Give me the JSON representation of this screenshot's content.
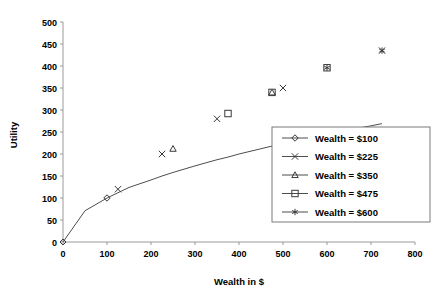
{
  "chart_data": {
    "type": "line",
    "title": "",
    "xlabel": "Wealth in $",
    "ylabel": "Utility",
    "xlim": [
      0,
      800
    ],
    "ylim": [
      0,
      500
    ],
    "xticks": [
      "0",
      "100",
      "200",
      "300",
      "400",
      "500",
      "600",
      "700",
      "800"
    ],
    "yticks": [
      "0",
      "50",
      "100",
      "150",
      "200",
      "250",
      "300",
      "350",
      "400",
      "450",
      "500"
    ],
    "grid": false,
    "legend_position": "center-right",
    "curve": {
      "name": "utility-curve",
      "x": [
        0,
        50,
        100,
        150,
        200,
        225,
        250,
        300,
        350,
        375,
        400,
        450,
        475,
        500,
        550,
        600,
        650,
        700,
        725
      ],
      "y": [
        0,
        71,
        100,
        124,
        141,
        150,
        158,
        173,
        187,
        193,
        200,
        212,
        218,
        224,
        234,
        245,
        255,
        264,
        269
      ]
    },
    "series": [
      {
        "name": "Wealth = $100",
        "marker": "diamond",
        "x": [
          100
        ],
        "y": [
          100
        ]
      },
      {
        "name": "Wealth = $225",
        "marker": "x",
        "x": [
          125,
          225,
          350,
          500,
          725
        ],
        "y": [
          120,
          200,
          280,
          350,
          435
        ]
      },
      {
        "name": "Wealth = $350",
        "marker": "triangle",
        "x": [
          250,
          475
        ],
        "y": [
          212,
          340
        ]
      },
      {
        "name": "Wealth = $475",
        "marker": "square",
        "x": [
          375,
          475,
          600
        ],
        "y": [
          292,
          340,
          396
        ]
      },
      {
        "name": "Wealth = $600",
        "marker": "asterisk",
        "x": [
          600,
          725
        ],
        "y": [
          396,
          435
        ]
      }
    ]
  },
  "axes": {
    "x_title": "Wealth in $",
    "y_title": "Utility",
    "x_tick_0": "0",
    "x_tick_1": "100",
    "x_tick_2": "200",
    "x_tick_3": "300",
    "x_tick_4": "400",
    "x_tick_5": "500",
    "x_tick_6": "600",
    "x_tick_7": "700",
    "x_tick_8": "800",
    "y_tick_0": "0",
    "y_tick_1": "50",
    "y_tick_2": "100",
    "y_tick_3": "150",
    "y_tick_4": "200",
    "y_tick_5": "250",
    "y_tick_6": "300",
    "y_tick_7": "350",
    "y_tick_8": "400",
    "y_tick_9": "450",
    "y_tick_10": "500"
  },
  "legend": {
    "items": [
      {
        "label": "Wealth = $100",
        "marker": "diamond"
      },
      {
        "label": "Wealth = $225",
        "marker": "x"
      },
      {
        "label": "Wealth = $350",
        "marker": "triangle"
      },
      {
        "label": "Wealth = $475",
        "marker": "square"
      },
      {
        "label": "Wealth = $600",
        "marker": "asterisk"
      }
    ]
  },
  "colors": {
    "line": "#4d4d4d",
    "axis": "#9a9a9a",
    "marker": "#3a3a3a",
    "legend_border": "#7a7a7a",
    "background": "#ffffff"
  }
}
